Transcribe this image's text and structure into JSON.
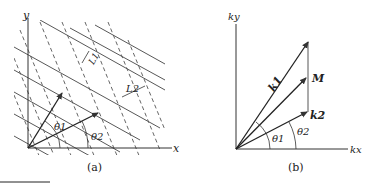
{
  "panel_a": {
    "caption": "(a)",
    "x_axis_label": "x",
    "y_axis_label": "y",
    "theta1_label": "θ1",
    "theta2_label": "θ2",
    "L1_label": "L1",
    "L2_label": "L2",
    "line_color": "#333333"
  },
  "panel_b": {
    "caption": "(b)",
    "x_axis_label": "kx",
    "y_axis_label": "ky",
    "k1_label": "k1",
    "k2_label": "k2",
    "M_label": "M",
    "theta1_label": "θ1",
    "theta2_label": "θ2",
    "line_color": "#333333"
  }
}
